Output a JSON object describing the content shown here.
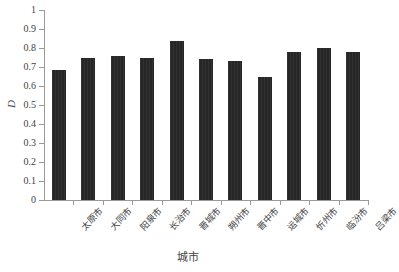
{
  "chart_data": {
    "type": "bar",
    "title": "",
    "xlabel": "城市",
    "ylabel": "D",
    "ylim": [
      0,
      1
    ],
    "ytick_labels": [
      "1",
      "0.9",
      "0.8",
      "0.7",
      "0.6",
      "0.5",
      "0.4",
      "0.3",
      "0.2",
      "0.1",
      "0"
    ],
    "ytick_values": [
      1,
      0.9,
      0.8,
      0.7,
      0.6,
      0.5,
      0.4,
      0.3,
      0.2,
      0.1,
      0
    ],
    "grid": false,
    "legend": null,
    "bar_color": "#262626",
    "categories": [
      "太原市",
      "大同市",
      "阳泉市",
      "长治市",
      "晋城市",
      "朔州市",
      "晋中市",
      "运城市",
      "忻州市",
      "临汾市",
      "吕梁市"
    ],
    "values": [
      0.685,
      0.748,
      0.758,
      0.747,
      0.836,
      0.743,
      0.731,
      0.645,
      0.778,
      0.8,
      0.781
    ]
  }
}
